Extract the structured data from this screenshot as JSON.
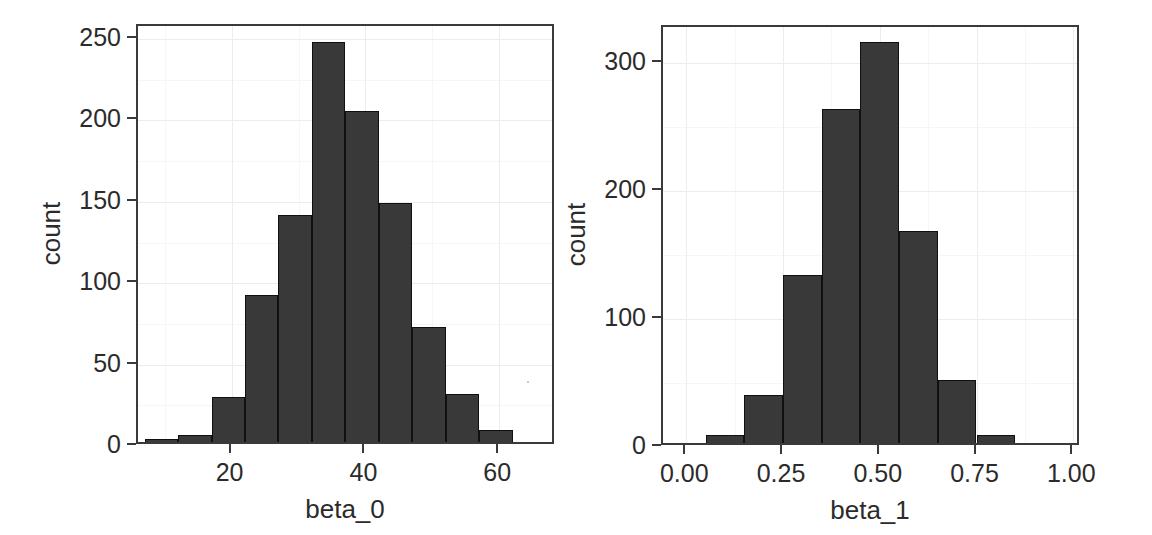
{
  "figure": {
    "background": "#ffffff",
    "bar_fill": "#393939",
    "bar_stroke": "#101010",
    "panel_border": "#3a3a3a",
    "grid_major": "#ececec",
    "grid_minor": "#f6f6f6"
  },
  "chart_data": [
    {
      "type": "bar",
      "title": "",
      "xlabel": "beta_0",
      "ylabel": "count",
      "grid": true,
      "legend": "none",
      "xlim": [
        6.0,
        68.5
      ],
      "ylim": [
        0,
        258
      ],
      "xticks": [
        20,
        40,
        60
      ],
      "xticklabels": [
        "20",
        "40",
        "60"
      ],
      "yticks": [
        0,
        50,
        100,
        150,
        200,
        250
      ],
      "yticklabels": [
        "0",
        "50",
        "100",
        "150",
        "200",
        "250"
      ],
      "bin_width": 5,
      "bin_edges": [
        7.0,
        12.0,
        17.0,
        22.0,
        27.0,
        32.0,
        37.0,
        42.0,
        47.0,
        52.0,
        57.0,
        62.0,
        67.0
      ],
      "bin_centers": [
        9.5,
        14.5,
        19.5,
        24.5,
        29.5,
        34.5,
        39.5,
        44.5,
        49.5,
        54.5,
        59.5,
        64.5
      ],
      "values": [
        4,
        7,
        30,
        93,
        142,
        248,
        206,
        149,
        73,
        32,
        10,
        2
      ]
    },
    {
      "type": "bar",
      "title": "",
      "xlabel": "beta_1",
      "ylabel": "count",
      "grid": true,
      "legend": "none",
      "xlim": [
        -0.06,
        1.02
      ],
      "ylim": [
        0,
        328
      ],
      "xticks": [
        0.0,
        0.25,
        0.5,
        0.75,
        1.0
      ],
      "xticklabels": [
        "0.00",
        "0.25",
        "0.50",
        "0.75",
        "1.00"
      ],
      "yticks": [
        0,
        100,
        200,
        300
      ],
      "yticklabels": [
        "0",
        "100",
        "200",
        "300"
      ],
      "bin_width": 0.1,
      "bin_edges": [
        -0.05,
        0.05,
        0.15,
        0.25,
        0.35,
        0.45,
        0.55,
        0.65,
        0.75,
        0.85,
        0.95
      ],
      "bin_centers": [
        0.0,
        0.1,
        0.2,
        0.3,
        0.4,
        0.5,
        0.6,
        0.7,
        0.8,
        0.9
      ],
      "values": [
        1,
        9,
        41,
        134,
        264,
        316,
        169,
        52,
        9,
        1
      ]
    }
  ]
}
